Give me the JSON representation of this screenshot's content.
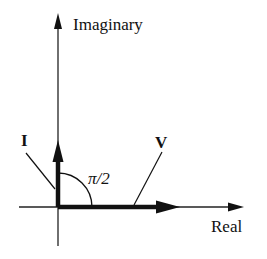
{
  "diagram": {
    "axes": {
      "imaginary_label": "Imaginary",
      "real_label": "Real"
    },
    "phasors": [
      {
        "name": "I",
        "label": "I",
        "direction": "imaginary"
      },
      {
        "name": "V",
        "label": "V",
        "direction": "real"
      }
    ],
    "angle_label": "π/2",
    "colors": {
      "stroke": "#111111",
      "background": "#ffffff"
    }
  }
}
